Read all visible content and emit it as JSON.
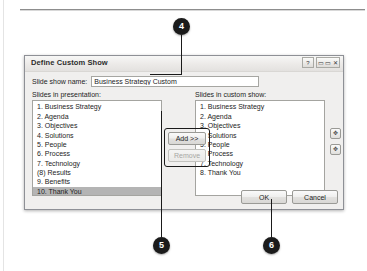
{
  "dialog": {
    "title": "Define Custom Show",
    "title_buttons": [
      {
        "name": "help-button",
        "glyph": "?"
      },
      {
        "name": "window-controls",
        "glyph": "▭ ▭ ✕"
      }
    ],
    "name_field": {
      "label": "Slide show name:",
      "value": "Business Strategy Custom",
      "placeholder": ""
    },
    "left_panel": {
      "label": "Slides in presentation:",
      "items": [
        {
          "text": "1. Business Strategy",
          "selected": false
        },
        {
          "text": "2. Agenda",
          "selected": false
        },
        {
          "text": "3. Objectives",
          "selected": false
        },
        {
          "text": "4. Solutions",
          "selected": false
        },
        {
          "text": "5. People",
          "selected": false
        },
        {
          "text": "6. Process",
          "selected": false
        },
        {
          "text": "7. Technology",
          "selected": false
        },
        {
          "text": "(8) Results",
          "selected": false
        },
        {
          "text": "9. Benefits",
          "selected": false
        },
        {
          "text": "10. Thank You",
          "selected": true
        }
      ]
    },
    "right_panel": {
      "label": "Slides in custom show:",
      "items": [
        {
          "text": "1. Business Strategy"
        },
        {
          "text": "2. Agenda"
        },
        {
          "text": "3. Objectives"
        },
        {
          "text": "4. Solutions"
        },
        {
          "text": "5. People"
        },
        {
          "text": "6. Process"
        },
        {
          "text": "7. Technology"
        },
        {
          "text": "8. Thank You"
        }
      ]
    },
    "transfer_buttons": {
      "add_label": "Add >>",
      "add_accel": "A",
      "remove_label": "Remove",
      "remove_enabled": false
    },
    "reorder_buttons": {
      "up_glyph": "✥",
      "down_glyph": "✥"
    },
    "footer_buttons": {
      "ok_label": "OK",
      "cancel_label": "Cancel"
    }
  },
  "callouts": [
    {
      "number": "4",
      "target": "slide-show-name-field"
    },
    {
      "number": "5",
      "target": "add-remove-buttons"
    },
    {
      "number": "6",
      "target": "ok-button"
    }
  ],
  "colors": {
    "dialog_face": "#f0efee",
    "selection": "#b4b4b4",
    "badge": "#1b1b1b",
    "border": "#8e9096"
  }
}
